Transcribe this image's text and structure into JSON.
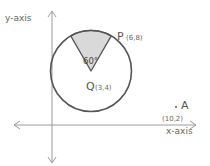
{
  "diagram": {
    "y_axis_label": "y-axis",
    "x_axis_label": "x-axis",
    "center": {
      "name": "Q",
      "coords": "(3,4)"
    },
    "point_p": {
      "name": "P",
      "coords": "(6,8)"
    },
    "point_a": {
      "name": "A",
      "coords": "(10,2)",
      "marker": "."
    },
    "sector_angle": "60°",
    "colors": {
      "circle_stroke": "#555555",
      "axis_stroke": "#888888",
      "sector_fill": "#d9d9d9"
    }
  }
}
